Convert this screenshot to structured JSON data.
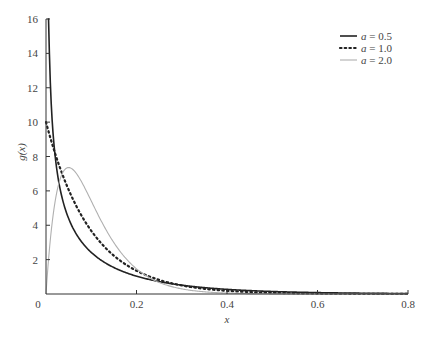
{
  "chart_data": {
    "type": "line",
    "title": "",
    "xlabel": "x",
    "ylabel": "g(x)",
    "xlim": [
      0,
      0.8
    ],
    "ylim": [
      0,
      16
    ],
    "xticks": [
      0,
      0.2,
      0.4,
      0.6,
      0.8
    ],
    "xtick_labels": [
      "0",
      "0.2",
      "0.4",
      "0.6",
      "0.8"
    ],
    "yticks": [
      2,
      4,
      6,
      8,
      10,
      12,
      14,
      16
    ],
    "ytick_labels": [
      "2",
      "4",
      "6",
      "8",
      "10",
      "12",
      "14",
      "16"
    ],
    "grid": false,
    "legend_position": "upper right",
    "series": [
      {
        "name": "a = 0.5",
        "shape": 0.5,
        "style": "solid",
        "color": "#222222",
        "width": 1.6,
        "x": [
          0.005,
          0.01,
          0.02,
          0.05,
          0.1,
          0.2,
          0.3,
          0.4,
          0.6,
          0.8
        ],
        "y": [
          30.7,
          21.3,
          14.4,
          7.8,
          4.3,
          1.82,
          0.88,
          0.45,
          0.13,
          0.04
        ]
      },
      {
        "name": "a = 1.0",
        "shape": 1.0,
        "style": "dotted",
        "color": "#222222",
        "width": 2.2,
        "x": [
          0,
          0.05,
          0.1,
          0.2,
          0.3,
          0.4,
          0.6,
          0.8
        ],
        "y": [
          10.0,
          6.07,
          3.68,
          1.35,
          0.5,
          0.18,
          0.02,
          0.003
        ]
      },
      {
        "name": "a = 2.0",
        "shape": 2.0,
        "style": "solid",
        "color": "#b0b0b0",
        "width": 1.1,
        "x": [
          0,
          0.025,
          0.05,
          0.1,
          0.15,
          0.2,
          0.3,
          0.4,
          0.6
        ],
        "y": [
          0,
          6.07,
          7.36,
          5.41,
          2.99,
          1.47,
          0.3,
          0.05,
          0.0
        ]
      }
    ]
  },
  "legend": {
    "items": [
      {
        "label": "a = 0.5"
      },
      {
        "label": "a = 1.0"
      },
      {
        "label": "a = 2.0"
      }
    ]
  },
  "axes": {
    "xlabel": "x",
    "ylabel": "g(x)"
  }
}
